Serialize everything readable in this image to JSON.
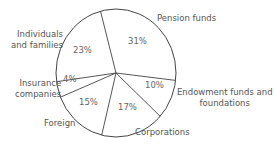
{
  "chart_data": {
    "type": "pie",
    "title": "",
    "slices": [
      {
        "label": "Pension funds",
        "value": 31,
        "pct_label": "31%"
      },
      {
        "label": "Endowment funds and foundations",
        "value": 10,
        "pct_label": "10%"
      },
      {
        "label": "Corporations",
        "value": 17,
        "pct_label": "17%"
      },
      {
        "label": "Foreign",
        "value": 15,
        "pct_label": "15%"
      },
      {
        "label": "Insurance companies",
        "value": 4,
        "pct_label": "4%"
      },
      {
        "label": "Individuals and families",
        "value": 23,
        "pct_label": "23%"
      }
    ],
    "fill": "#ffffff",
    "stroke": "#444444"
  },
  "labels": {
    "pension": "Pension funds",
    "endowment_1": "Endowment funds and",
    "endowment_2": "foundations",
    "corporations": "Corporations",
    "foreign": "Foreign",
    "insurance_1": "Insurance",
    "insurance_2": "companies",
    "individuals_1": "Individuals",
    "individuals_2": "and families"
  }
}
